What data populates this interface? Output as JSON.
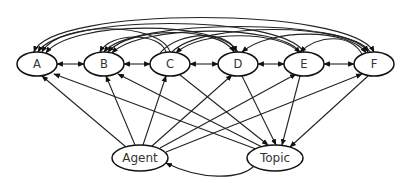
{
  "diagram": {
    "type": "directed-graph",
    "nodes": {
      "A": {
        "label": "A",
        "x": 37,
        "y": 64,
        "rx": 20,
        "ry": 12
      },
      "B": {
        "label": "B",
        "x": 104,
        "y": 64,
        "rx": 20,
        "ry": 12
      },
      "C": {
        "label": "C",
        "x": 170,
        "y": 64,
        "rx": 20,
        "ry": 12
      },
      "D": {
        "label": "D",
        "x": 238,
        "y": 64,
        "rx": 20,
        "ry": 12
      },
      "E": {
        "label": "E",
        "x": 304,
        "y": 64,
        "rx": 20,
        "ry": 12
      },
      "F": {
        "label": "F",
        "x": 374,
        "y": 64,
        "rx": 20,
        "ry": 12
      },
      "Agent": {
        "label": "Agent",
        "x": 140,
        "y": 158,
        "rx": 28,
        "ry": 13
      },
      "Topic": {
        "label": "Topic",
        "x": 275,
        "y": 158,
        "rx": 28,
        "ry": 13
      }
    },
    "edges_description": "Bidirectional arrows between adjacent nodes A-B, B-C, C-D, D-E, E-F; curved arcs over the top connecting every pair of top nodes; Agent and Topic each connect by arrows to all top nodes A-F; Agent and Topic connected by a curved arrow below."
  }
}
